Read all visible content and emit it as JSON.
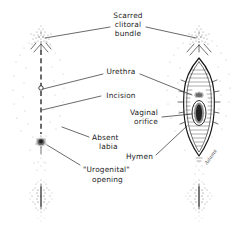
{
  "figure": {
    "background_color": "#ffffff",
    "ink_color": "#1b1b1b",
    "width": 246,
    "height": 240
  },
  "labels": {
    "scarred_clitoral_bundle": {
      "line1": "Scarred",
      "line2": "clitoral",
      "line3": "bundle"
    },
    "urethra": "Urethra",
    "incision": "Incision",
    "vaginal_orifice": {
      "line1": "Vaginal",
      "line2": "orifice"
    },
    "hymen": "Hymen",
    "absent_labia": {
      "line1": "Absent",
      "line2": "labia"
    },
    "urogenital_opening": {
      "line1": "\"Urogenital\"",
      "line2": "opening"
    },
    "signature": "Adams"
  },
  "panels": {
    "left": {
      "name": "infibulated-vulva-closed",
      "features": [
        "scarred clitoral bundle",
        "vertical midline incision line",
        "urethral meatus",
        "absent labia",
        "urogenital opening",
        "anal region"
      ]
    },
    "right": {
      "name": "vulva-after-defibulation",
      "features": [
        "scarred clitoral bundle",
        "urethra",
        "vaginal orifice",
        "hymen",
        "anal region"
      ]
    }
  }
}
